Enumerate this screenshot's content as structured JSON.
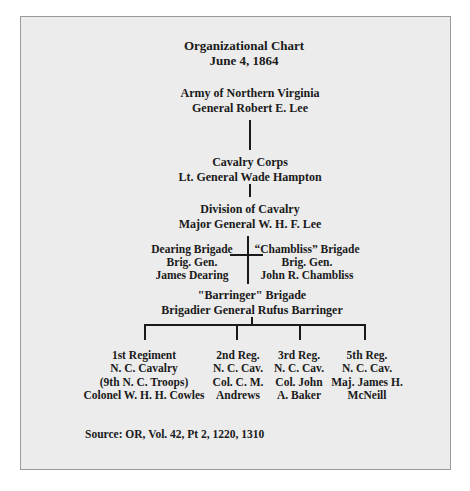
{
  "title": {
    "line1": "Organizational Chart",
    "line2": "June 4, 1864"
  },
  "nodes": {
    "army": {
      "unit": "Army of Northern Virginia",
      "commander": "General Robert E. Lee"
    },
    "corps": {
      "unit": "Cavalry Corps",
      "commander": "Lt. General Wade Hampton"
    },
    "division": {
      "unit": "Division of Cavalry",
      "commander": "Major General W. H. F. Lee"
    },
    "dearing_brigade": {
      "unit": "Dearing Brigade",
      "rank": "Brig. Gen.",
      "commander": "James Dearing"
    },
    "chambliss_brigade": {
      "unit": "“Chambliss” Brigade",
      "rank": "Brig. Gen.",
      "commander": "John R. Chambliss"
    },
    "barringer_brigade": {
      "unit": "\"Barringer\" Brigade",
      "commander": "Brigadier General Rufus Barringer"
    }
  },
  "regiments": [
    {
      "lines": [
        "1st Regiment",
        "N. C. Cavalry",
        "(9th N. C. Troops)",
        "Colonel W. H. H. Cowles"
      ]
    },
    {
      "lines": [
        "2nd Reg.",
        "N. C. Cav.",
        "Col. C. M.",
        "Andrews"
      ]
    },
    {
      "lines": [
        "3rd Reg.",
        "N. C. Cav.",
        "Col. John",
        "A. Baker"
      ]
    },
    {
      "lines": [
        "5th Reg.",
        "N. C. Cav.",
        "Maj. James H.",
        "McNeill"
      ]
    }
  ],
  "source": "Source: OR, Vol. 42, Pt 2, 1220, 1310",
  "colors": {
    "background": "#ececec",
    "border": "#9a9a9a",
    "text": "#1a1a1a"
  }
}
